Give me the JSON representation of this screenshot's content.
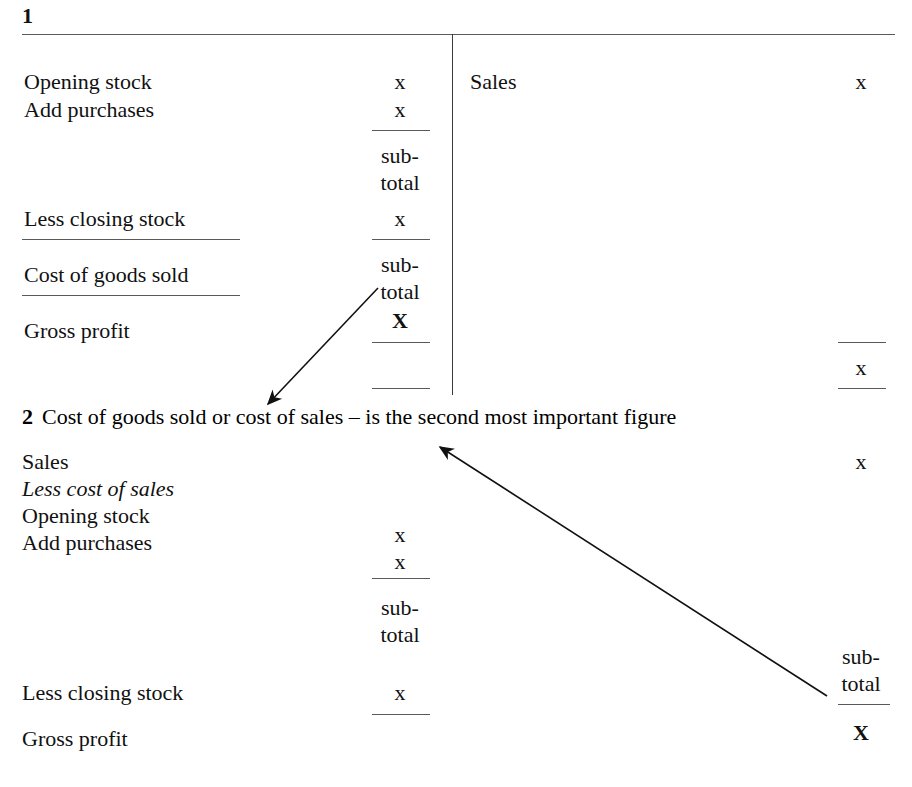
{
  "document": {
    "title": "Trading account layouts",
    "ink_color": "#111111",
    "rule_color": "#5a5a5a",
    "background": "#ffffff"
  },
  "section_one": {
    "number": "1",
    "left_account": {
      "rows": [
        {
          "label": "Opening stock",
          "amount": "x"
        },
        {
          "label": "Add purchases",
          "amount": "x"
        },
        {
          "label": "",
          "amount": "sub-"
        },
        {
          "label": "",
          "amount": "total"
        },
        {
          "label": "Less closing stock",
          "amount": "x"
        },
        {
          "label": "Cost of goods sold",
          "amount": "sub-"
        },
        {
          "label": "",
          "amount": "total"
        },
        {
          "label": "Gross profit",
          "amount": "X"
        }
      ]
    },
    "right_account": {
      "rows": [
        {
          "label": "Sales",
          "amount": "x"
        },
        {
          "label": "",
          "amount": "x"
        }
      ]
    }
  },
  "section_two": {
    "number": "2",
    "heading_text": "Cost of goods sold or cost of sales  –  is the second most important figure",
    "rows": [
      {
        "label": "Sales",
        "middle": "",
        "right": "x",
        "italic": false
      },
      {
        "label": "Less cost of sales",
        "middle": "",
        "right": "",
        "italic": true
      },
      {
        "label": "Opening stock",
        "middle": "x",
        "right": "",
        "italic": false
      },
      {
        "label": "Add purchases",
        "middle": "x",
        "right": "",
        "italic": false
      },
      {
        "label": "",
        "middle": "sub-",
        "right": "",
        "italic": false
      },
      {
        "label": "",
        "middle": "total",
        "right": "",
        "italic": false
      },
      {
        "label": "",
        "middle": "",
        "right": "sub-",
        "italic": false
      },
      {
        "label": "Less closing stock",
        "middle": "x",
        "right": "total",
        "italic": false
      },
      {
        "label": "Gross profit",
        "middle": "",
        "right": "X",
        "italic": false
      }
    ]
  },
  "annotations": {
    "arrow_one": {
      "name": "arrow-cost-of-goods-sold-to-heading",
      "from": "sub-total (cost of goods sold) in section 1",
      "to": "Cost of goods sold in section 2 heading"
    },
    "arrow_two": {
      "name": "arrow-subtotal-to-cost-of-sales",
      "from": "sub-total in section 2 right column",
      "to": "cost of sales in section 2 heading"
    }
  }
}
